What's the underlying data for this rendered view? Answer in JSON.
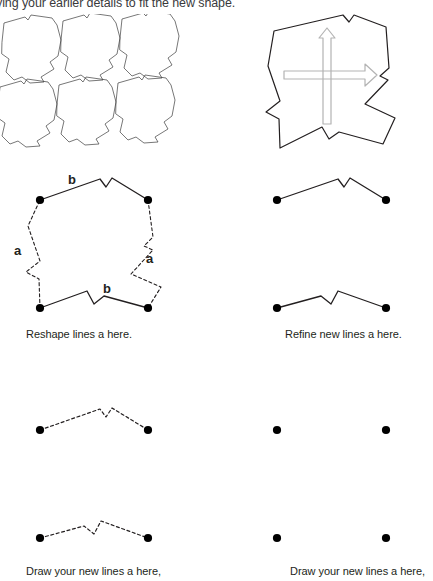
{
  "worksheet": {
    "instruction": "ying your earlier details to fit the new shape.",
    "panels": {
      "tessellation": {
        "name": "tessellation-grid",
        "rows": 2,
        "cols": 3,
        "tile_count": 6,
        "stroke_color": "#3c3c3c"
      },
      "arrow_diagram": {
        "name": "single-tile-with-translation-arrows",
        "stroke_color": "#231f20",
        "arrow_color": "#b3b3b3",
        "arrows": [
          {
            "direction": "up",
            "label": ""
          },
          {
            "direction": "right",
            "label": ""
          }
        ]
      },
      "reference_shape": {
        "name": "reference-tile-with-edge-labels",
        "solid_edges_label": "b",
        "dashed_edges_label": "a",
        "corner_dot_count": 4,
        "labels": {
          "b_top": "b",
          "b_bottom": "b",
          "a_left": "a",
          "a_right": "a"
        }
      },
      "refine_lines": {
        "name": "solid-b-polylines",
        "polyline_count": 2,
        "style": "solid",
        "endpoint_dot_count": 4
      },
      "draw_left": {
        "name": "dashed-b-polylines",
        "polyline_count": 2,
        "style": "dashed",
        "endpoint_dot_count": 4
      },
      "draw_right": {
        "name": "blank-practice-dots",
        "polyline_count": 0,
        "style": "none",
        "endpoint_dot_count": 4
      }
    },
    "captions": {
      "reshape": "Reshape lines a here.",
      "refine": "Refine new lines a here.",
      "draw_left": "Draw your new lines a here,",
      "draw_right": "Draw your new lines a here,"
    }
  }
}
